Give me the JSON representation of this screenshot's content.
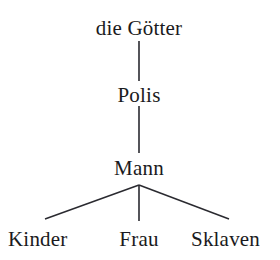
{
  "diagram": {
    "type": "hierarchy-tree",
    "orientation": "top-down",
    "background_color": "#ffffff",
    "text_color": "#1a1a20",
    "line_color": "#2a2a30",
    "levels": 4,
    "nodes": {
      "goetter": {
        "label": "die Götter",
        "level": 1,
        "center_x": 139,
        "baseline_y": 38
      },
      "polis": {
        "label": "Polis",
        "level": 2,
        "center_x": 139,
        "baseline_y": 103
      },
      "mann": {
        "label": "Mann",
        "level": 3,
        "center_x": 139,
        "baseline_y": 178
      },
      "kinder": {
        "label": "Kinder",
        "level": 4,
        "center_x": 70,
        "baseline_y": 249
      },
      "frau": {
        "label": "Frau",
        "level": 4,
        "center_x": 139,
        "baseline_y": 249
      },
      "sklaven": {
        "label": "Sklaven",
        "level": 4,
        "center_x": 229,
        "baseline_y": 249
      }
    },
    "edges": [
      {
        "id": "edge-goetter-polis",
        "from": "goetter",
        "to": "polis",
        "kind": "vertical",
        "x1": 139,
        "y1": 41,
        "x2": 139,
        "y2": 81
      },
      {
        "id": "edge-polis-mann",
        "from": "polis",
        "to": "mann",
        "kind": "vertical",
        "x1": 139,
        "y1": 106,
        "x2": 139,
        "y2": 153
      },
      {
        "id": "edge-mann-kinder",
        "from": "mann",
        "to": "kinder",
        "kind": "diagonal-left",
        "x1": 139,
        "y1": 185,
        "x2": 45,
        "y2": 219
      },
      {
        "id": "edge-mann-frau",
        "from": "mann",
        "to": "frau",
        "kind": "vertical",
        "x1": 139,
        "y1": 185,
        "x2": 139,
        "y2": 221
      },
      {
        "id": "edge-mann-sklaven",
        "from": "mann",
        "to": "sklaven",
        "kind": "diagonal-right",
        "x1": 139,
        "y1": 185,
        "x2": 229,
        "y2": 219
      }
    ]
  }
}
